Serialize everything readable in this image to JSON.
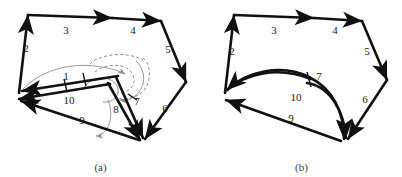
{
  "figure": {
    "background_color": "#ffffff",
    "stroke_color": "#111111",
    "arc_color": "#8c8c8c",
    "label_color": "#1a1a1a",
    "panels": [
      {
        "id": "a",
        "caption": "(a)",
        "edge_labels": [
          {
            "id": "label-1",
            "text": "1",
            "x": 66,
            "y": 80
          },
          {
            "id": "label-2",
            "text": "2",
            "x": 26,
            "y": 52
          },
          {
            "id": "label-3",
            "text": "3",
            "x": 66,
            "y": 24
          },
          {
            "id": "label-4",
            "text": "4",
            "x": 133,
            "y": 28
          },
          {
            "id": "label-5",
            "text": "5",
            "x": 166,
            "y": 53
          },
          {
            "id": "label-6",
            "text": "6",
            "x": 163,
            "y": 112
          },
          {
            "id": "label-7",
            "text": "7",
            "x": 134,
            "y": 104
          },
          {
            "id": "label-8",
            "text": "8",
            "x": 117,
            "y": 112
          },
          {
            "id": "label-9",
            "text": "9",
            "x": 82,
            "y": 123
          },
          {
            "id": "label-10",
            "text": "10",
            "x": 69,
            "y": 100
          }
        ]
      },
      {
        "id": "b",
        "caption": "(b)",
        "edge_labels": [
          {
            "id": "label-2",
            "text": "2",
            "x": 31,
            "y": 52
          },
          {
            "id": "label-3",
            "text": "3",
            "x": 73,
            "y": 24
          },
          {
            "id": "label-4",
            "text": "4",
            "x": 134,
            "y": 28
          },
          {
            "id": "label-5",
            "text": "5",
            "x": 163,
            "y": 55
          },
          {
            "id": "label-6",
            "text": "6",
            "x": 162,
            "y": 101
          },
          {
            "id": "label-7",
            "text": "7",
            "x": 116,
            "y": 80
          },
          {
            "id": "label-9",
            "text": "9",
            "x": 90,
            "y": 120
          },
          {
            "id": "label-10",
            "text": "10",
            "x": 95,
            "y": 99
          }
        ]
      }
    ]
  }
}
